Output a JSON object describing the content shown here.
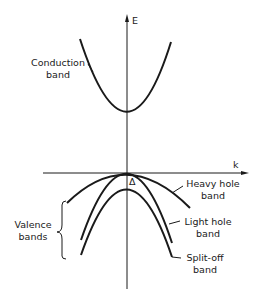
{
  "axes": {
    "y_label": "E",
    "x_label": "k"
  },
  "bands": {
    "conduction": {
      "line1": "Conduction",
      "line2": "band"
    },
    "heavy_hole": {
      "line1": "Heavy hole",
      "line2": "band"
    },
    "light_hole": {
      "line1": "Light hole",
      "line2": "band"
    },
    "split_off": {
      "line1": "Split-off",
      "line2": "band"
    },
    "valence_group": {
      "line1": "Valence",
      "line2": "bands"
    }
  },
  "annotations": {
    "split_off_energy": "Δ"
  },
  "colors": {
    "line": "#1a1a1a",
    "background": "#ffffff"
  }
}
